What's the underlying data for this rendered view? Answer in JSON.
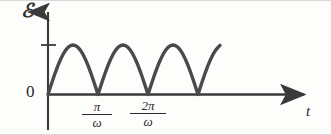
{
  "figure": {
    "name": "emf-vs-time-rectified-sine",
    "background_color": "#fdfdfc",
    "ink_color": "#3a3a3a",
    "border_color": "#d8d8d6"
  },
  "axes": {
    "y_label": "ℰ",
    "y_label_name": "emf-symbol",
    "x_label": "t",
    "x_label_name": "time-symbol",
    "origin_label": "0",
    "y_axis_arrow": true,
    "x_axis_arrow": true,
    "origin_px": {
      "x": 48,
      "y": 94.5
    },
    "x_axis_end_px": 312,
    "y_axis_top_px": 8,
    "y_axis_bottom_px": 130,
    "peak_tick_y_px": 45,
    "peak_tick_label": ""
  },
  "ticks": [
    {
      "label_num": "π",
      "label_den": "ω",
      "x_px": 97
    },
    {
      "label_num": "2π",
      "label_den": "ω",
      "x_px": 147
    }
  ],
  "chart_data": {
    "type": "line",
    "title": "",
    "xlabel": "t",
    "ylabel": "ℰ",
    "curve_name": "full-wave-rectified-sine",
    "formula": "|sin(ωt)|",
    "amplitude": 1,
    "half_period_px": 50,
    "cusps_px": [
      97,
      147,
      197
    ],
    "curve_start_px": {
      "x": 48,
      "y": 94.5
    },
    "curve_end_px": {
      "x": 220,
      "y": 45
    },
    "stroke_width": 3.4,
    "grid": false,
    "legend": null,
    "xlim": [
      0,
      3.45
    ],
    "ylim": [
      0,
      1.15
    ],
    "x_tick_values": [
      1,
      2
    ],
    "x_tick_labels": [
      "π/ω",
      "2π/ω"
    ],
    "y_tick_values": [
      0,
      1
    ],
    "y_tick_labels": [
      "0",
      ""
    ],
    "x": [
      0,
      0.05,
      0.1,
      0.15,
      0.2,
      0.25,
      0.3,
      0.35,
      0.4,
      0.45,
      0.5,
      0.55,
      0.6,
      0.65,
      0.7,
      0.75,
      0.8,
      0.85,
      0.9,
      0.95,
      1.0,
      1.05,
      1.1,
      1.15,
      1.2,
      1.25,
      1.3,
      1.35,
      1.4,
      1.45,
      1.5,
      1.55,
      1.6,
      1.65,
      1.7,
      1.75,
      1.8,
      1.85,
      1.9,
      1.95,
      2.0,
      2.05,
      2.1,
      2.15,
      2.2,
      2.25,
      2.3,
      2.35,
      2.4,
      2.45,
      2.5,
      2.55,
      2.6,
      2.65,
      2.7,
      2.75,
      2.8,
      2.85,
      2.9,
      2.95,
      3.0,
      3.05,
      3.1,
      3.15,
      3.2,
      3.25,
      3.3,
      3.35,
      3.4,
      3.44
    ],
    "y": [
      0,
      0.156,
      0.309,
      0.454,
      0.588,
      0.707,
      0.809,
      0.891,
      0.951,
      0.988,
      1.0,
      0.988,
      0.951,
      0.891,
      0.809,
      0.707,
      0.588,
      0.454,
      0.309,
      0.156,
      0,
      0.156,
      0.309,
      0.454,
      0.588,
      0.707,
      0.809,
      0.891,
      0.951,
      0.988,
      1.0,
      0.988,
      0.951,
      0.891,
      0.809,
      0.707,
      0.588,
      0.454,
      0.309,
      0.156,
      0,
      0.156,
      0.309,
      0.454,
      0.588,
      0.707,
      0.809,
      0.891,
      0.951,
      0.988,
      1.0,
      0.988,
      0.951,
      0.891,
      0.809,
      0.707,
      0.588,
      0.454,
      0.309,
      0.156,
      0,
      0.156,
      0.309,
      0.454,
      0.588,
      0.707,
      0.809,
      0.891,
      0.951,
      0.992
    ]
  }
}
